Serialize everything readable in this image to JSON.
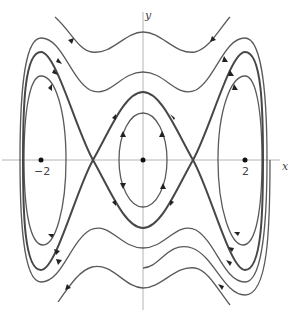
{
  "diagram": {
    "type": "phase-portrait",
    "axes": {
      "x_label": "x",
      "y_label": "y"
    },
    "ticks": {
      "left": "−2",
      "right": "2"
    },
    "equilibria": [
      {
        "x": -2,
        "y": 0,
        "kind": "center"
      },
      {
        "x": 0,
        "y": 0,
        "kind": "center"
      },
      {
        "x": 2,
        "y": 0,
        "kind": "center"
      },
      {
        "x": -1,
        "y": 0,
        "kind": "saddle"
      },
      {
        "x": 1,
        "y": 0,
        "kind": "saddle"
      }
    ],
    "colors": {
      "curve": "#555555",
      "separatrix": "#444444",
      "axis": "#b0b0b0",
      "arrow": "#222222"
    }
  }
}
